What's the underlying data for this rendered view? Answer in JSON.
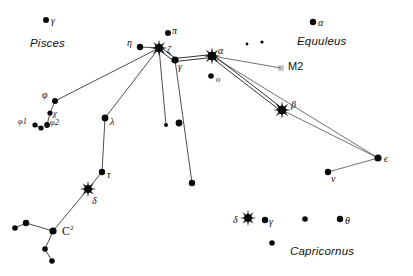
{
  "chart_data": {
    "type": "scatter",
    "title": "",
    "grid": false,
    "legend": null,
    "xlabel": "",
    "ylabel": "",
    "xlim": [
      0,
      413
    ],
    "ylim": [
      0,
      276
    ],
    "constellation_labels": [
      {
        "name": "Pisces",
        "x": 30,
        "y": 38
      },
      {
        "name": "Equuleus",
        "x": 297,
        "y": 36
      },
      {
        "name": "Capricornus",
        "x": 290,
        "y": 246
      }
    ],
    "deep_sky_objects": [
      {
        "name": "M2",
        "type": "globular-cluster",
        "x": 281,
        "y": 68,
        "label_x": 288,
        "label_y": 61
      }
    ],
    "stars": [
      {
        "id": "pisces-gamma",
        "label": "γ",
        "x": 46,
        "y": 20,
        "r": 3.0,
        "marker": "dot",
        "label_x": 51,
        "label_y": 16
      },
      {
        "id": "aqr-phi",
        "label": "φ",
        "x": 55,
        "y": 101,
        "r": 3.0,
        "marker": "dot",
        "label_x": 42,
        "label_y": 90
      },
      {
        "id": "aqr-chi",
        "label": "χ",
        "x": 50,
        "y": 113,
        "r": 2.6,
        "marker": "dot",
        "label_x": 53,
        "label_y": 109
      },
      {
        "id": "aqr-phi1",
        "label": "φ1",
        "x": 35,
        "y": 125,
        "r": 2.6,
        "marker": "dot",
        "label_x": 18,
        "label_y": 117
      },
      {
        "id": "aqr-phi1b",
        "label": "",
        "x": 41,
        "y": 128,
        "r": 2.6,
        "marker": "dot",
        "label_x": 0,
        "label_y": 0
      },
      {
        "id": "aqr-phi2",
        "label": "φ2",
        "x": 47,
        "y": 125,
        "r": 2.9,
        "marker": "dot",
        "label_x": 50,
        "label_y": 118
      },
      {
        "id": "aqr-eta",
        "label": "η",
        "x": 140,
        "y": 47,
        "r": 3.2,
        "marker": "dot",
        "label_x": 127,
        "label_y": 38
      },
      {
        "id": "aqr-zeta",
        "label": "ζ",
        "x": 159,
        "y": 48,
        "r": 5.4,
        "marker": "burst",
        "label_x": 167,
        "label_y": 45
      },
      {
        "id": "aqr-pi",
        "label": "π",
        "x": 168,
        "y": 33,
        "r": 3.0,
        "marker": "dot",
        "label_x": 172,
        "label_y": 26
      },
      {
        "id": "aqr-gamma",
        "label": "γ",
        "x": 175,
        "y": 60,
        "r": 3.6,
        "marker": "dot",
        "label_x": 178,
        "label_y": 62
      },
      {
        "id": "aqr-alpha",
        "label": "α",
        "x": 212,
        "y": 56,
        "r": 5.6,
        "marker": "burst",
        "label_x": 218,
        "label_y": 46
      },
      {
        "id": "aqr-omicron",
        "label": "o",
        "x": 211,
        "y": 76,
        "r": 2.8,
        "marker": "dot",
        "label_x": 216,
        "label_y": 75
      },
      {
        "id": "aqr-beta",
        "label": "β",
        "x": 282,
        "y": 110,
        "r": 5.6,
        "marker": "burst",
        "label_x": 291,
        "label_y": 100
      },
      {
        "id": "equ-alpha",
        "label": "α",
        "x": 313,
        "y": 22,
        "r": 3.2,
        "marker": "dot",
        "label_x": 318,
        "label_y": 18
      },
      {
        "id": "equ-faint1",
        "label": "",
        "x": 247,
        "y": 44,
        "r": 1.4,
        "marker": "dot",
        "label_x": 0,
        "label_y": 0
      },
      {
        "id": "equ-faint2",
        "label": "",
        "x": 262,
        "y": 42,
        "r": 1.6,
        "marker": "dot",
        "label_x": 0,
        "label_y": 0
      },
      {
        "id": "aqr-lambda",
        "label": "λ",
        "x": 105,
        "y": 118,
        "r": 3.4,
        "marker": "dot",
        "label_x": 110,
        "label_y": 117
      },
      {
        "id": "aqr-tau",
        "label": "τ",
        "x": 102,
        "y": 172,
        "r": 3.2,
        "marker": "dot",
        "label_x": 107,
        "label_y": 170
      },
      {
        "id": "aqr-delta",
        "label": "δ",
        "x": 88,
        "y": 189,
        "r": 5.0,
        "marker": "burst",
        "label_x": 92,
        "label_y": 196
      },
      {
        "id": "aqr-c2",
        "label": "",
        "x": 53,
        "y": 231,
        "r": 3.6,
        "marker": "dot",
        "label_x": 0,
        "label_y": 0
      },
      {
        "id": "aqr-c2-a",
        "label": "",
        "x": 26,
        "y": 223,
        "r": 3.2,
        "marker": "dot",
        "label_x": 0,
        "label_y": 0
      },
      {
        "id": "aqr-c2-b",
        "label": "",
        "x": 15,
        "y": 228,
        "r": 2.8,
        "marker": "dot",
        "label_x": 0,
        "label_y": 0
      },
      {
        "id": "aqr-c2-c",
        "label": "",
        "x": 45,
        "y": 249,
        "r": 2.8,
        "marker": "dot",
        "label_x": 0,
        "label_y": 0
      },
      {
        "id": "aqr-c2-d",
        "label": "",
        "x": 52,
        "y": 261,
        "r": 2.8,
        "marker": "dot",
        "label_x": 0,
        "label_y": 0
      },
      {
        "id": "aqr-mid1",
        "label": "",
        "x": 179,
        "y": 123,
        "r": 3.4,
        "marker": "dot",
        "label_x": 0,
        "label_y": 0
      },
      {
        "id": "aqr-mid2",
        "label": "",
        "x": 166,
        "y": 125,
        "r": 2.0,
        "marker": "dot",
        "label_x": 0,
        "label_y": 0
      },
      {
        "id": "aqr-mid3",
        "label": "",
        "x": 192,
        "y": 183,
        "r": 3.2,
        "marker": "dot",
        "label_x": 0,
        "label_y": 0
      },
      {
        "id": "aqr-epsilon",
        "label": "ϵ",
        "x": 378,
        "y": 158,
        "r": 3.6,
        "marker": "dot",
        "label_x": 384,
        "label_y": 154
      },
      {
        "id": "aqr-nu",
        "label": "ν",
        "x": 328,
        "y": 172,
        "r": 3.2,
        "marker": "dot",
        "label_x": 331,
        "label_y": 174
      },
      {
        "id": "cap-delta",
        "label": "δ",
        "x": 248,
        "y": 218,
        "r": 5.0,
        "marker": "burst",
        "label_x": 233,
        "label_y": 215
      },
      {
        "id": "cap-gamma",
        "label": "γ",
        "x": 265,
        "y": 220,
        "r": 3.2,
        "marker": "dot",
        "label_x": 269,
        "label_y": 217
      },
      {
        "id": "cap-faint",
        "label": "",
        "x": 305,
        "y": 219,
        "r": 2.8,
        "marker": "dot",
        "label_x": 0,
        "label_y": 0
      },
      {
        "id": "cap-theta",
        "label": "θ",
        "x": 340,
        "y": 219,
        "r": 3.2,
        "marker": "dot",
        "label_x": 345,
        "label_y": 216
      },
      {
        "id": "cap-lower",
        "label": "",
        "x": 272,
        "y": 243,
        "r": 2.8,
        "marker": "dot",
        "label_x": 0,
        "label_y": 0
      }
    ],
    "lines": [
      {
        "from": "aqr-phi",
        "to": "aqr-zeta",
        "style": "single"
      },
      {
        "from": "aqr-phi",
        "to": "aqr-chi",
        "style": "single"
      },
      {
        "from": "aqr-chi",
        "to": "aqr-phi2",
        "style": "single"
      },
      {
        "from": "aqr-phi1",
        "to": "aqr-phi1b",
        "style": "single"
      },
      {
        "from": "aqr-eta",
        "to": "aqr-zeta",
        "style": "single"
      },
      {
        "from": "aqr-zeta",
        "to": "aqr-gamma",
        "style": "double"
      },
      {
        "from": "aqr-zeta",
        "to": "aqr-lambda",
        "style": "single"
      },
      {
        "from": "aqr-zeta",
        "to": "aqr-mid2",
        "style": "single"
      },
      {
        "from": "aqr-gamma",
        "to": "aqr-alpha",
        "style": "double"
      },
      {
        "from": "aqr-gamma",
        "to": "aqr-mid3",
        "style": "single"
      },
      {
        "from": "aqr-alpha",
        "to": "aqr-beta",
        "style": "double"
      },
      {
        "from": "aqr-alpha",
        "to": "M2",
        "style": "thin"
      },
      {
        "from": "aqr-alpha",
        "to": "aqr-epsilon",
        "style": "thin"
      },
      {
        "from": "aqr-beta",
        "to": "aqr-epsilon",
        "style": "thin"
      },
      {
        "from": "aqr-epsilon",
        "to": "aqr-nu",
        "style": "thin"
      },
      {
        "from": "aqr-lambda",
        "to": "aqr-tau",
        "style": "single"
      },
      {
        "from": "aqr-tau",
        "to": "aqr-delta",
        "style": "single"
      },
      {
        "from": "aqr-delta",
        "to": "aqr-c2",
        "style": "single"
      },
      {
        "from": "aqr-c2",
        "to": "aqr-c2-a",
        "style": "single"
      },
      {
        "from": "aqr-c2-a",
        "to": "aqr-c2-b",
        "style": "single"
      },
      {
        "from": "aqr-c2",
        "to": "aqr-c2-c",
        "style": "single"
      },
      {
        "from": "aqr-c2-c",
        "to": "aqr-c2-d",
        "style": "single"
      }
    ],
    "annotations": [
      {
        "name": "c2-label",
        "text": "C",
        "superscript": "2",
        "x": 62,
        "y": 225
      }
    ]
  }
}
